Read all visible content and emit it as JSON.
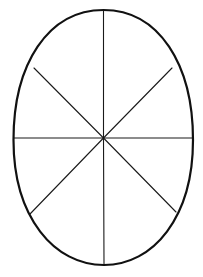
{
  "diagram": {
    "title": "Egg divided into eight segments",
    "shape": "egg",
    "segments": 8,
    "colors": {
      "background": "#ffffff",
      "outline": "#111111",
      "divider": "#1a1a1a"
    },
    "outline": {
      "top": [
        103.5,
        10
      ],
      "bottom": [
        104,
        265
      ],
      "left": [
        13.5,
        140
      ],
      "right": [
        193,
        140
      ],
      "stroke_width": 2.2
    },
    "center": [
      103.5,
      138
    ],
    "dividers": [
      {
        "name": "vertical-top",
        "from": [
          103.5,
          138
        ],
        "to": [
          103.5,
          10
        ]
      },
      {
        "name": "vertical-bottom",
        "from": [
          103.5,
          138
        ],
        "to": [
          104,
          265
        ]
      },
      {
        "name": "horizontal-left",
        "from": [
          103.5,
          138
        ],
        "to": [
          14,
          138
        ]
      },
      {
        "name": "horizontal-right",
        "from": [
          103.5,
          138
        ],
        "to": [
          193,
          138
        ]
      },
      {
        "name": "diagonal-upper-left",
        "from": [
          103.5,
          138
        ],
        "to": [
          34,
          68
        ]
      },
      {
        "name": "diagonal-upper-right",
        "from": [
          103.5,
          138
        ],
        "to": [
          172,
          68
        ]
      },
      {
        "name": "diagonal-lower-left",
        "from": [
          103.5,
          138
        ],
        "to": [
          30,
          214
        ]
      },
      {
        "name": "diagonal-lower-right",
        "from": [
          103.5,
          138
        ],
        "to": [
          176,
          212
        ]
      }
    ]
  }
}
